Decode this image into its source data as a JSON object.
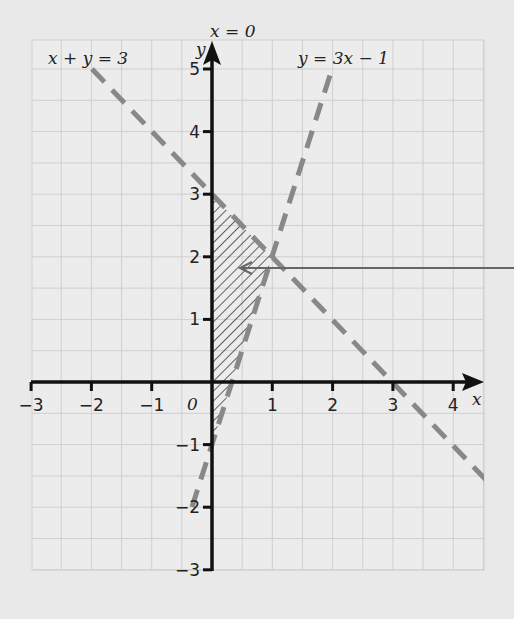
{
  "chart_data": {
    "type": "line",
    "title": "",
    "xlabel": "x",
    "ylabel": "y",
    "xlim": [
      -3,
      4
    ],
    "ylim": [
      -3,
      5
    ],
    "grid": true,
    "x_ticks": [
      "-3",
      "-2",
      "-1",
      "0",
      "1",
      "2",
      "3",
      "4"
    ],
    "y_ticks": [
      "-3",
      "-2",
      "-1",
      "1",
      "2",
      "3",
      "4",
      "5"
    ],
    "origin_label": "0",
    "series": [
      {
        "name": "x + y = 3",
        "style": "dashed",
        "points": [
          [
            -2,
            5
          ],
          [
            4.4,
            -1.4
          ]
        ]
      },
      {
        "name": "y = 3x - 1",
        "style": "dashed",
        "points": [
          [
            -0.33,
            -2
          ],
          [
            2,
            5
          ]
        ]
      },
      {
        "name": "x = 0",
        "style": "solid-axis"
      }
    ],
    "annotations": [
      {
        "text": "x + y = 3",
        "position": "top-left"
      },
      {
        "text": "y = 3x − 1",
        "position": "top-center-right"
      },
      {
        "text": "x = 0",
        "position": "above y-axis"
      }
    ],
    "shaded_region": {
      "description": "hatched region bounded by x=0, x+y<3, y>3x-1",
      "vertices": [
        [
          0,
          3
        ],
        [
          1,
          2
        ],
        [
          0,
          -1
        ]
      ]
    },
    "pointer_arrow": {
      "from": [
        5,
        1.8
      ],
      "to": [
        0.4,
        1.8
      ]
    }
  },
  "labels": {
    "line1": "x + y = 3",
    "line2": "y = 3x − 1",
    "yaxis_eq": "x = 0",
    "x_axis": "x",
    "y_axis": "y",
    "origin": "0",
    "xt": [
      "−3",
      "−2",
      "−1",
      "1",
      "2",
      "3",
      "4"
    ],
    "yt": [
      "5",
      "4",
      "3",
      "2",
      "1",
      "−1",
      "−2",
      "−3"
    ]
  }
}
